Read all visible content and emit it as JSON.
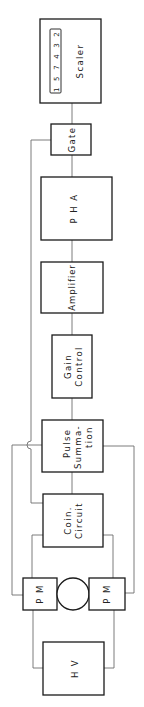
{
  "diagram": {
    "type": "block-diagram",
    "orientation": "rotated -90deg (reads bottom to top)",
    "blocks": {
      "scaler": {
        "label": "Scaler",
        "counter": "1 5 7 4 3 2"
      },
      "gate": {
        "label": "Gate"
      },
      "pha": {
        "label": "P H A"
      },
      "amplifier": {
        "label": "Amplifier"
      },
      "gain_control": {
        "line1": "Gain",
        "line2": "Control"
      },
      "pulse_summation": {
        "line1": "Pulse",
        "line2": "Summa-",
        "line3": "tion"
      },
      "coin_circuit": {
        "line1": "Coin.",
        "line2": "Circuit"
      },
      "pm_left": {
        "label": "P M"
      },
      "pm_right": {
        "label": "P M"
      },
      "hv": {
        "label": "H V"
      }
    },
    "connections": [
      [
        "HV",
        "PM (left)"
      ],
      [
        "HV",
        "PM (right)"
      ],
      [
        "PM (left)",
        "Coin. Circuit"
      ],
      [
        "PM (right)",
        "Coin. Circuit"
      ],
      [
        "PM (left)",
        "Pulse Summation"
      ],
      [
        "PM (right)",
        "Pulse Summation"
      ],
      [
        "Coin. Circuit",
        "Gate"
      ],
      [
        "Pulse Summation",
        "Gain Control"
      ],
      [
        "Gain Control",
        "Amplifier"
      ],
      [
        "Amplifier",
        "PHA"
      ],
      [
        "PHA",
        "Gate"
      ],
      [
        "Gate",
        "Scaler"
      ]
    ],
    "colors": {
      "line": "#1a1a1a",
      "wire": "#6e6e6e",
      "background": "#ffffff"
    }
  }
}
